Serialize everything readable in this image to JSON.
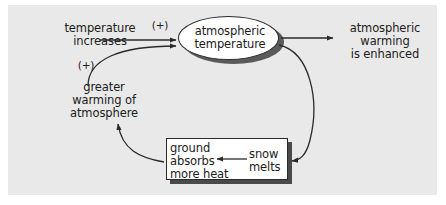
{
  "figure": {
    "kind": "feedback-loop-diagram",
    "background_color": "#ffffff",
    "panel_color": "#e9e9e9",
    "line_color": "#2a2a2a",
    "text_color": "#1b1b1b"
  },
  "nodes": {
    "temperature_increases": {
      "label": "temperature\nincreases",
      "shape": "text"
    },
    "atmospheric_temperature": {
      "label": "atmospheric\ntemperature",
      "shape": "ellipse"
    },
    "atmospheric_warming": {
      "label": "atmospheric\nwarming\nis enhanced",
      "shape": "text"
    },
    "greater_warming": {
      "label": "greater\nwarming of\natmosphere",
      "shape": "text"
    },
    "ground_absorbs": {
      "label": "ground\nabsorbs\nmore heat",
      "shape": "rectangle"
    },
    "snow_melts": {
      "label": "snow\nmelts",
      "shape": "text"
    }
  },
  "signs": {
    "top_plus": "(+)",
    "bottom_plus": "(+)"
  },
  "edges": [
    {
      "name": "temperature-increases-to-atmospheric-temperature",
      "from": "temperature_increases",
      "to": "atmospheric_temperature",
      "sign": "(+)",
      "style": "straight"
    },
    {
      "name": "atmospheric-temperature-to-atmospheric-warming",
      "from": "atmospheric_temperature",
      "to": "atmospheric_warming",
      "sign": "",
      "style": "straight"
    },
    {
      "name": "greater-warming-to-atmospheric-temperature",
      "from": "greater_warming",
      "to": "atmospheric_temperature",
      "sign": "(+)",
      "style": "curved"
    },
    {
      "name": "atmospheric-temperature-to-snow-melts",
      "from": "atmospheric_temperature",
      "to": "snow_melts",
      "sign": "",
      "style": "curved"
    },
    {
      "name": "snow-melts-to-ground-absorbs",
      "from": "snow_melts",
      "to": "ground_absorbs",
      "sign": "",
      "style": "straight"
    },
    {
      "name": "ground-absorbs-to-greater-warming",
      "from": "ground_absorbs",
      "to": "greater_warming",
      "sign": "",
      "style": "curved"
    }
  ]
}
